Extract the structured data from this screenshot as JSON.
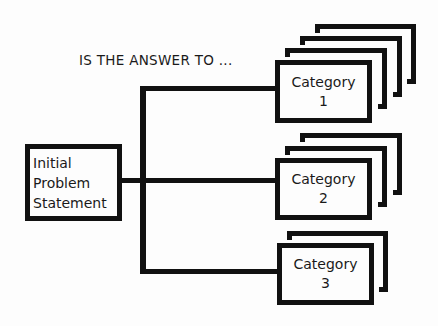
{
  "diagram": {
    "heading": "IS THE ANSWER TO ...",
    "root": {
      "line1": "Initial",
      "line2": "Problem",
      "line3": "Statement"
    },
    "categories": [
      {
        "label": "Category",
        "number": "1",
        "stack_layers": 3
      },
      {
        "label": "Category",
        "number": "2",
        "stack_layers": 2
      },
      {
        "label": "Category",
        "number": "3",
        "stack_layers": 1
      }
    ]
  },
  "colors": {
    "stroke": "#111111",
    "background": "#fdfdfd"
  }
}
